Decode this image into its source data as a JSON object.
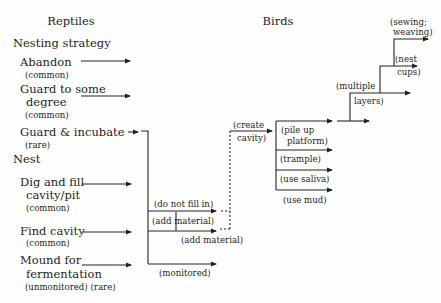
{
  "headers": {
    "reptiles": "Reptiles",
    "birds": "Birds"
  },
  "sections": {
    "nesting_strategy": "Nesting strategy",
    "nest": "Nest"
  },
  "reptiles": {
    "nesting_strategy": [
      {
        "lines": [
          "Abandon"
        ],
        "freq": "(common)"
      },
      {
        "lines": [
          "Guard to some",
          "degree"
        ],
        "freq": "(common)"
      },
      {
        "lines": [
          "Guard & incubate"
        ],
        "freq": "(rare)"
      }
    ],
    "nest": [
      {
        "lines": [
          "Dig and fill",
          "cavity/pit"
        ],
        "freq": "(common)"
      },
      {
        "lines": [
          "Find cavity"
        ],
        "freq": "(common)"
      },
      {
        "lines": [
          "Mound for",
          "fermentation"
        ],
        "freq": "(unmonitored)  (rare)"
      }
    ]
  },
  "branches": {
    "do_not_fill_in": "(do not fill in)",
    "add_material_1": "(add material)",
    "add_material_2": "(add material)",
    "monitored": "(monitored)",
    "create_cavity": [
      "(create",
      "cavity)"
    ]
  },
  "birds": {
    "construction": [
      {
        "lines": [
          "(pile up",
          "platform)"
        ]
      },
      {
        "lines": [
          "(trample)"
        ]
      },
      {
        "lines": [
          "(use saliva)"
        ]
      },
      {
        "lines": [
          "(use mud)"
        ]
      }
    ],
    "progression": [
      {
        "lines": [
          "(multiple",
          "layers)"
        ]
      },
      {
        "lines": [
          "(nest",
          "cups)"
        ]
      },
      {
        "lines": [
          "(sewing;",
          "weaving)"
        ]
      }
    ]
  }
}
